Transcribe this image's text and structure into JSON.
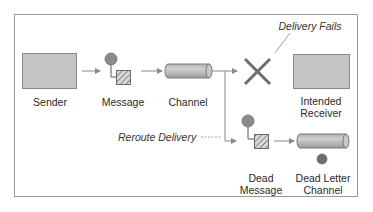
{
  "diagram": {
    "nodes": [
      {
        "id": "sender",
        "label": "Sender",
        "shape": "rectangle"
      },
      {
        "id": "message",
        "label": "Message",
        "shape": "message-icon"
      },
      {
        "id": "channel",
        "label": "Channel",
        "shape": "cylinder-pipe"
      },
      {
        "id": "failure",
        "label": "",
        "shape": "x-mark"
      },
      {
        "id": "receiver",
        "label_line1": "Intended",
        "label_line2": "Receiver",
        "shape": "rectangle"
      },
      {
        "id": "dead_message",
        "label_line1": "Dead",
        "label_line2": "Message",
        "shape": "message-icon"
      },
      {
        "id": "dead_letter_channel",
        "label_line1": "Dead Letter",
        "label_line2": "Channel",
        "shape": "cylinder-pipe"
      }
    ],
    "edges": [
      {
        "from": "sender",
        "to": "message"
      },
      {
        "from": "message",
        "to": "channel"
      },
      {
        "from": "channel",
        "to": "failure"
      },
      {
        "from": "channel",
        "to": "dead_message",
        "label": "Reroute Delivery"
      },
      {
        "from": "dead_message",
        "to": "dead_letter_channel"
      }
    ],
    "annotations": {
      "delivery_fails": "Delivery Fails",
      "reroute_delivery": "Reroute Delivery"
    },
    "labels": {
      "sender": "Sender",
      "message": "Message",
      "channel": "Channel",
      "receiver_1": "Intended",
      "receiver_2": "Receiver",
      "dead_message_1": "Dead",
      "dead_message_2": "Message",
      "dlc_1": "Dead Letter",
      "dlc_2": "Channel"
    },
    "colors": {
      "box_fill": "#c4c4c4",
      "box_stroke": "#8a8a8a",
      "circle_fill": "#8c8c8c",
      "x_mark": "#6e6e6e",
      "frame": "#9a9a9a",
      "arrow": "#8a8a8a"
    }
  }
}
